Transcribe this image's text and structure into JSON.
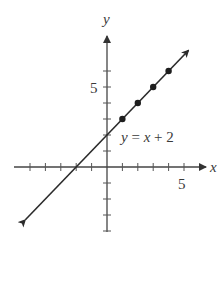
{
  "chart_data": {
    "type": "line",
    "title": "",
    "xlabel": "x",
    "ylabel": "y",
    "xlim": [
      -6,
      6
    ],
    "ylim": [
      -4,
      7
    ],
    "grid": false,
    "x_ticks": [
      -5,
      -4,
      -3,
      -2,
      -1,
      1,
      2,
      3,
      4,
      5
    ],
    "y_ticks": [
      -4,
      -3,
      -2,
      -1,
      1,
      2,
      3,
      4,
      5,
      6
    ],
    "x_tick_labels": [
      {
        "value": 5,
        "label": "5"
      }
    ],
    "y_tick_labels": [
      {
        "value": 5,
        "label": "5"
      }
    ],
    "series": [
      {
        "name": "y = x + 2",
        "equation": "y = x + 2",
        "slope": 1,
        "intercept": 2,
        "x_range": [
          -5.3,
          5.3
        ],
        "arrows_both_ends": true,
        "points": [
          {
            "x": 1,
            "y": 3
          },
          {
            "x": 2,
            "y": 4
          },
          {
            "x": 3,
            "y": 5
          },
          {
            "x": 4,
            "y": 6
          }
        ]
      }
    ],
    "annotations": [
      {
        "text": "y = x + 2",
        "x": 0.9,
        "y": 1.6
      }
    ]
  },
  "labels": {
    "x_axis": "x",
    "y_axis": "y",
    "x_tick_5": "5",
    "y_tick_5": "5",
    "equation": "y = x + 2"
  },
  "style": {
    "axis_color": "#444444",
    "line_color": "#2b2b2b",
    "point_color": "#1e1e1e"
  }
}
